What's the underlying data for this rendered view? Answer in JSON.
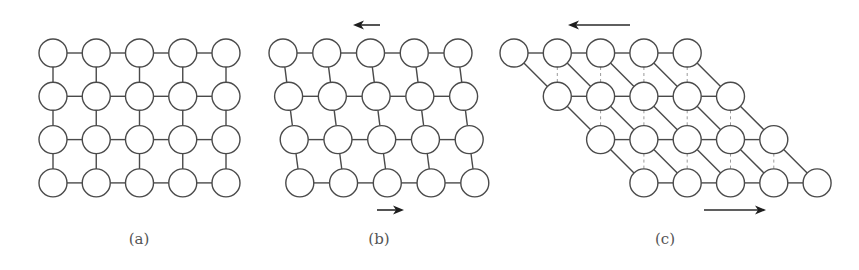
{
  "figure": {
    "width": 859,
    "height": 270,
    "colors": {
      "stroke": "#4a4a4a",
      "ghost": "#9a9a9a",
      "arrow": "#1e1e1e",
      "caption": "#555555",
      "background": "#ffffff"
    },
    "node_radius": 14,
    "rows": 4,
    "cols": 5
  },
  "panels": [
    {
      "id": "a",
      "label": "(a)",
      "label_x": 139,
      "label_y": 244,
      "origin_x": 53,
      "origin_y": 53,
      "spacing_x": 43.25,
      "spacing_y": 43.3,
      "row_shift": 0,
      "diagonals": false,
      "ghost_lines": false,
      "arrows": []
    },
    {
      "id": "b",
      "label": "(b)",
      "label_x": 379,
      "label_y": 244,
      "origin_x": 283,
      "origin_y": 53,
      "spacing_x": 43.75,
      "spacing_y": 43.3,
      "row_shift": 5.6,
      "diagonals": false,
      "ghost_lines": false,
      "arrows": [
        {
          "name": "top-arrow-left",
          "x1": 380,
          "x2": 353,
          "y": 25
        },
        {
          "name": "bottom-arrow-right",
          "x1": 377,
          "x2": 404,
          "y": 210
        }
      ]
    },
    {
      "id": "c",
      "label": "(c)",
      "label_x": 665,
      "label_y": 244,
      "origin_x": 514,
      "origin_y": 53,
      "spacing_x": 43.3,
      "spacing_y": 43.3,
      "row_shift": 43.3,
      "diagonals": true,
      "ghost_lines": true,
      "arrows": [
        {
          "name": "top-arrow-left",
          "x1": 630,
          "x2": 568,
          "y": 25
        },
        {
          "name": "bottom-arrow-right",
          "x1": 704,
          "x2": 766,
          "y": 210
        }
      ]
    }
  ]
}
